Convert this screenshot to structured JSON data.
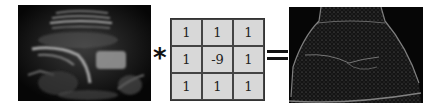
{
  "figure": {
    "input_image": {
      "label": "ultrasound-input",
      "description": "grayscale ultrasound scan"
    },
    "operator_convolution": "*",
    "kernel": {
      "rows": [
        [
          "1",
          "1",
          "1"
        ],
        [
          "1",
          "-9",
          "1"
        ],
        [
          "1",
          "1",
          "1"
        ]
      ],
      "cell_color": "#d8d8d8",
      "border_color": "#444444"
    },
    "operator_equals": "=",
    "output_image": {
      "label": "edge-filtered-output",
      "description": "high-pass filtered ultrasound showing edges"
    }
  }
}
